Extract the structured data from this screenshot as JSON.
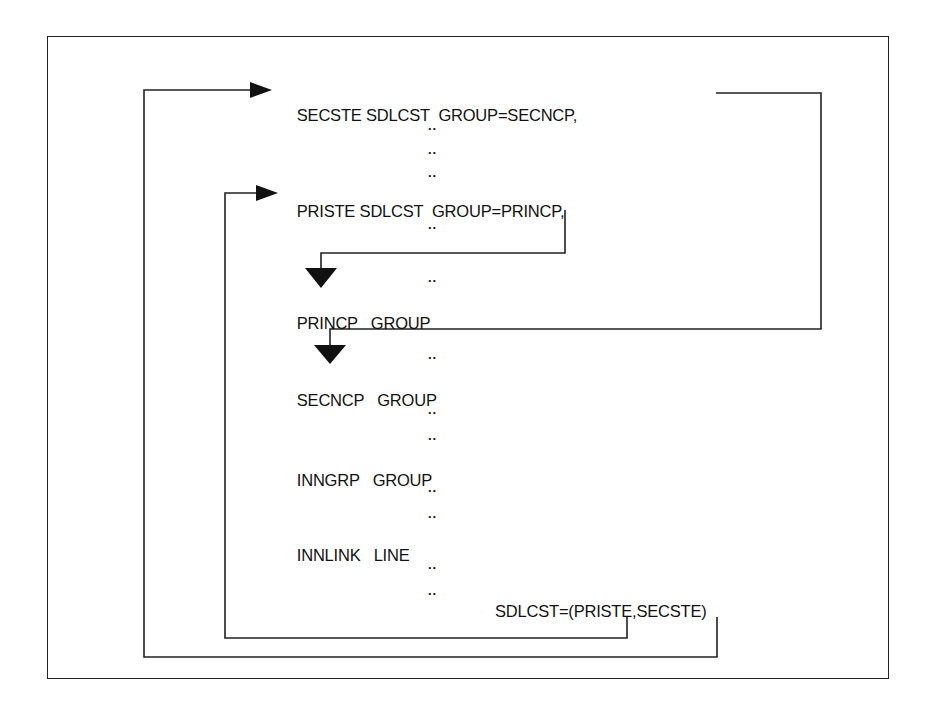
{
  "diagram": {
    "statements": [
      {
        "id": "secste",
        "label": "SECSTE",
        "type": "SDLCST",
        "operand": "GROUP=SECNCP,"
      },
      {
        "id": "priste",
        "label": "PRISTE",
        "type": "SDLCST",
        "operand": "GROUP=PRINCP,"
      },
      {
        "id": "princp",
        "label": "PRINCP",
        "type": "GROUP"
      },
      {
        "id": "secncp",
        "label": "SECNCP",
        "type": "GROUP"
      },
      {
        "id": "inngrp",
        "label": "INNGRP",
        "type": "GROUP"
      },
      {
        "id": "innlink",
        "label": "INNLINK",
        "type": "LINE"
      }
    ],
    "sdlcst_operand": "SDLCST=(PRISTE,SECSTE)",
    "ellipsis": "..",
    "connections": [
      {
        "from": "SECSTE GROUP=SECNCP",
        "to": "SECNCP GROUP"
      },
      {
        "from": "PRISTE GROUP=PRINCP",
        "to": "PRINCP GROUP"
      },
      {
        "from": "SDLCST=(PRISTE,...)",
        "to": "PRISTE SDLCST"
      },
      {
        "from": "SDLCST=(...,SECSTE)",
        "to": "SECSTE SDLCST"
      }
    ],
    "colors": {
      "line": "#222222",
      "text": "#111111",
      "background": "#ffffff"
    }
  }
}
